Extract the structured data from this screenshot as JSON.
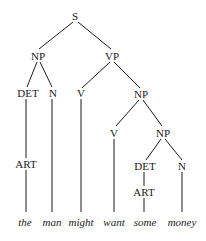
{
  "diagram": {
    "type": "syntax-tree",
    "nodes": {
      "S": "S",
      "NP1": "NP",
      "VP": "VP",
      "DET1": "DET",
      "N1": "N",
      "V1": "V",
      "NP2": "NP",
      "ART1": "ART",
      "V2": "V",
      "NP3": "NP",
      "DET2": "DET",
      "N2": "N",
      "ART2": "ART"
    },
    "words": [
      "the",
      "man",
      "might",
      "want",
      "some",
      "money"
    ],
    "edges": [
      [
        "S",
        "NP1"
      ],
      [
        "S",
        "VP"
      ],
      [
        "NP1",
        "DET1"
      ],
      [
        "NP1",
        "N1"
      ],
      [
        "VP",
        "V1"
      ],
      [
        "VP",
        "NP2"
      ],
      [
        "DET1",
        "ART1"
      ],
      [
        "ART1",
        "the"
      ],
      [
        "N1",
        "man"
      ],
      [
        "V1",
        "might"
      ],
      [
        "NP2",
        "V2"
      ],
      [
        "NP2",
        "NP3"
      ],
      [
        "V2",
        "want"
      ],
      [
        "NP3",
        "DET2"
      ],
      [
        "NP3",
        "N2"
      ],
      [
        "DET2",
        "ART2"
      ],
      [
        "ART2",
        "some"
      ],
      [
        "N2",
        "money"
      ]
    ]
  }
}
